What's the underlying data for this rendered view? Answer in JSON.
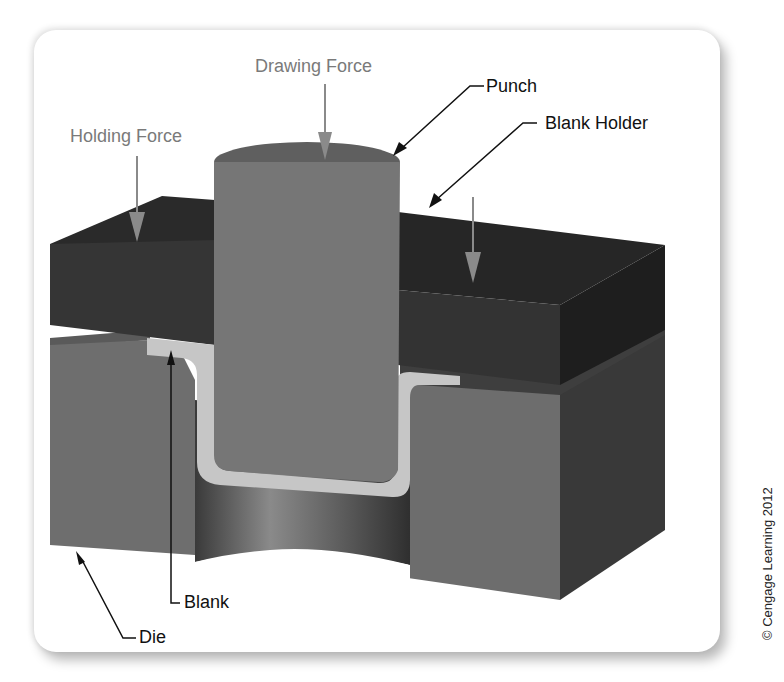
{
  "figure": {
    "labels": {
      "drawing_force": "Drawing Force",
      "holding_force": "Holding Force",
      "punch": "Punch",
      "blank_holder": "Blank Holder",
      "blank": "Blank",
      "die": "Die"
    },
    "copyright": "© Cengage Learning 2012",
    "colors": {
      "background": "#ffffff",
      "blank_holder_top": "#2b2b2b",
      "blank_holder_front": "#373737",
      "blank_holder_side": "#1f1f1f",
      "punch_front": "#767676",
      "punch_top": "#5f5f5f",
      "die_front": "#6f6f6f",
      "die_side": "#3c3c3c",
      "blank": "#c4c4c4",
      "force_arrow": "#8a8a8a",
      "leader_line": "#111111"
    }
  }
}
